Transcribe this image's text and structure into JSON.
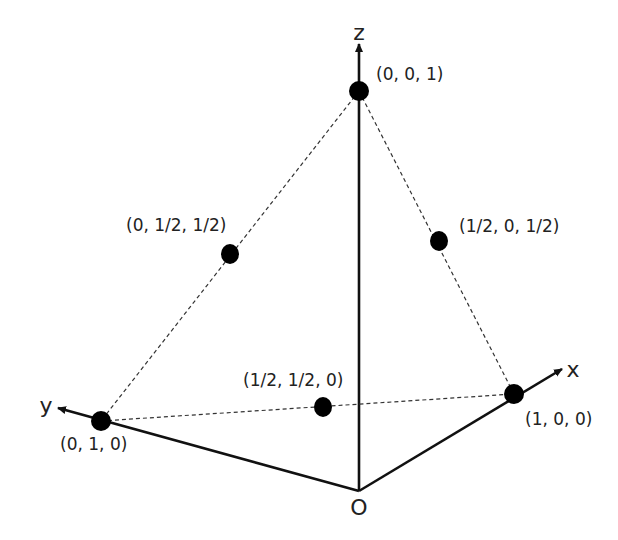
{
  "diagram": {
    "type": "3d-coordinate-simplex",
    "colors": {
      "background": "#ffffff",
      "ink": "#111111",
      "text": "#222222"
    },
    "origin": {
      "label": "O"
    },
    "axes": [
      {
        "id": "x",
        "label": "x"
      },
      {
        "id": "y",
        "label": "y"
      },
      {
        "id": "z",
        "label": "z"
      }
    ],
    "points": [
      {
        "id": "z-vertex",
        "label": "(0, 0, 1)"
      },
      {
        "id": "y-vertex",
        "label": "(0, 1, 0)"
      },
      {
        "id": "x-vertex",
        "label": "(1, 0, 0)"
      },
      {
        "id": "yz-mid",
        "label": "(0, 1/2, 1/2)"
      },
      {
        "id": "xz-mid",
        "label": "(1/2, 0, 1/2)"
      },
      {
        "id": "xy-mid",
        "label": "(1/2, 1/2, 0)"
      }
    ],
    "edges_dashed": [
      [
        "z-vertex",
        "y-vertex"
      ],
      [
        "z-vertex",
        "x-vertex"
      ],
      [
        "y-vertex",
        "x-vertex"
      ]
    ]
  }
}
